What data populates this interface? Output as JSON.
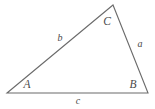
{
  "figure": {
    "type": "triangle-diagram",
    "background_color": "#ffffff",
    "stroke_color": "#6b6b6b",
    "label_color": "#4a4a4a"
  },
  "vertices": [
    {
      "label": "A",
      "x": 7,
      "y": 93,
      "label_x": 27,
      "label_y": 85
    },
    {
      "label": "B",
      "x": 148,
      "y": 93,
      "label_x": 133,
      "label_y": 85
    },
    {
      "label": "C",
      "x": 113,
      "y": 5,
      "label_x": 107,
      "label_y": 22
    }
  ],
  "sides": [
    {
      "label": "a",
      "from": "B",
      "to": "C",
      "label_x": 140,
      "label_y": 44
    },
    {
      "label": "b",
      "from": "A",
      "to": "C",
      "label_x": 60,
      "label_y": 38
    },
    {
      "label": "c",
      "from": "A",
      "to": "B",
      "label_x": 78,
      "label_y": 101
    }
  ],
  "paths": {
    "outline": "M 7 93 L 113 5 L 148 93 Z"
  }
}
